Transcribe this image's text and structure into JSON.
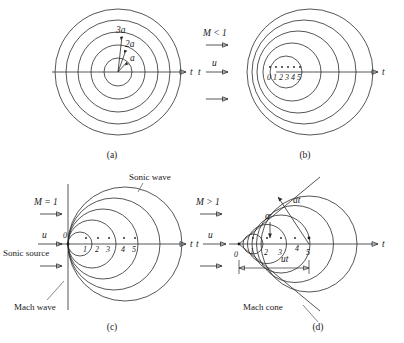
{
  "figure": {
    "title_partial": "",
    "panels": [
      {
        "id": "a",
        "caption": "(a)",
        "mach_label": "",
        "flow_label": "",
        "axis_label": "t",
        "radius_labels": [
          "a",
          "2a",
          "3a"
        ],
        "point_numbers": [],
        "annotations": [],
        "circle_count": 5,
        "description": "stationary source, concentric sonic waves"
      },
      {
        "id": "b",
        "caption": "(b)",
        "mach_label": "M < 1",
        "flow_label": "u",
        "axis_label": "t",
        "left_axis_label": "t",
        "radius_labels": [],
        "point_numbers": [
          "0",
          "1",
          "2",
          "3",
          "4",
          "5"
        ],
        "annotations": [],
        "circle_count": 5,
        "description": "subsonic source, nested non-concentric waves"
      },
      {
        "id": "c",
        "caption": "(c)",
        "mach_label": "M = 1",
        "flow_label": "u",
        "axis_label": "t",
        "origin_label": "0",
        "point_numbers": [
          "1",
          "2",
          "3",
          "4",
          "5"
        ],
        "annotations": [
          "Sonic wave",
          "Sonic source",
          "Mach wave"
        ],
        "circle_count": 5,
        "description": "sonic source, waves tangent to vertical Mach wave"
      },
      {
        "id": "d",
        "caption": "(d)",
        "mach_label": "M > 1",
        "flow_label": "u",
        "axis_label": "t",
        "left_axis_label": "t",
        "origin_label": "0",
        "point_numbers": [
          "1",
          "2",
          "3",
          "4",
          "5"
        ],
        "radius_label": "at",
        "angle_label": "α",
        "dimension_label": "ut",
        "annotations": [
          "Mach cone"
        ],
        "circle_count": 5,
        "description": "supersonic source, Mach cone envelope"
      }
    ],
    "colors": {
      "stroke": "#2b2b2b",
      "leader": "#555555",
      "background": "#ffffff",
      "text": "#1a1a1a"
    }
  }
}
